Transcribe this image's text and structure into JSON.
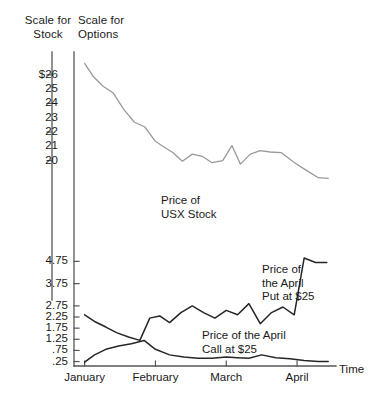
{
  "header": {
    "stock_scale_label": "Scale for\nStock",
    "options_scale_label": "Scale for\nOptions"
  },
  "axes": {
    "time_label": "Time",
    "stock_axis_name": "Scale for Stock",
    "options_axis_name": "Scale for Options"
  },
  "chart_data": {
    "type": "line",
    "title": "",
    "subtitle": "",
    "xlabel": "Time",
    "ylabel": "",
    "grid": false,
    "legend_position": "inline-annotations",
    "x_tick_labels": [
      "January",
      "February",
      "March",
      "April"
    ],
    "x_tick_positions": [
      0,
      1,
      2,
      3
    ],
    "xlim": [
      -0.15,
      3.55
    ],
    "stock_axis": {
      "name": "Scale for Stock",
      "tick_labels": [
        "$26",
        "25",
        "24",
        "23",
        "22",
        "21",
        "20"
      ],
      "ticked_marks": [
        "$26",
        "24",
        "22",
        "20"
      ],
      "tick_values": [
        26,
        25,
        24,
        23,
        22,
        21,
        20
      ],
      "ylim": [
        19.2,
        26.9
      ]
    },
    "options_axis": {
      "name": "Scale for Options",
      "tick_labels": [
        "4.75",
        "3.75",
        "2.75",
        "2.25",
        "1.75",
        "1.25",
        ".75",
        ".25"
      ],
      "tick_values": [
        4.75,
        3.75,
        2.75,
        2.25,
        1.75,
        1.25,
        0.75,
        0.25
      ],
      "ylim": [
        0.05,
        5.35
      ]
    },
    "series": [
      {
        "name": "Price of USX Stock",
        "axis": "stock",
        "color": "#9a9a9a",
        "annotation": "Price of\nUSX Stock",
        "x": [
          0.0,
          0.12,
          0.26,
          0.4,
          0.55,
          0.7,
          0.85,
          1.0,
          1.12,
          1.25,
          1.38,
          1.52,
          1.66,
          1.8,
          1.95,
          2.08,
          2.2,
          2.34,
          2.48,
          2.62,
          2.78,
          2.95,
          3.12,
          3.3,
          3.44
        ],
        "y": [
          26.8,
          25.9,
          25.2,
          24.75,
          23.6,
          22.7,
          22.35,
          21.35,
          20.95,
          20.55,
          19.95,
          20.45,
          20.3,
          19.85,
          20.0,
          21.05,
          19.75,
          20.45,
          20.7,
          20.6,
          20.55,
          19.9,
          19.35,
          18.8,
          18.75
        ]
      },
      {
        "name": "Price of the April Put at $25",
        "axis": "options",
        "color": "#262626",
        "annotation": "Price of\nthe April\nPut at $25",
        "x": [
          0.0,
          0.14,
          0.3,
          0.45,
          0.62,
          0.78,
          0.92,
          1.06,
          1.2,
          1.36,
          1.52,
          1.68,
          1.84,
          2.0,
          2.16,
          2.32,
          2.48,
          2.64,
          2.8,
          2.96,
          3.1,
          3.26,
          3.42
        ],
        "y": [
          2.35,
          2.05,
          1.8,
          1.55,
          1.35,
          1.2,
          2.2,
          2.3,
          2.0,
          2.45,
          2.75,
          2.45,
          2.2,
          2.55,
          2.35,
          2.85,
          1.95,
          2.45,
          2.7,
          2.35,
          4.9,
          4.7,
          4.7
        ]
      },
      {
        "name": "Price of the April Call at $25",
        "axis": "options",
        "color": "#262626",
        "annotation": "Price of the April\nCall at $25",
        "x": [
          0.0,
          0.14,
          0.3,
          0.48,
          0.66,
          0.84,
          1.0,
          1.2,
          1.4,
          1.6,
          1.8,
          2.0,
          2.16,
          2.32,
          2.5,
          2.7,
          2.9,
          3.1,
          3.3,
          3.44
        ],
        "y": [
          0.22,
          0.55,
          0.8,
          0.95,
          1.05,
          1.2,
          0.8,
          0.55,
          0.45,
          0.4,
          0.4,
          0.45,
          0.42,
          0.4,
          0.55,
          0.42,
          0.38,
          0.3,
          0.25,
          0.25
        ]
      }
    ]
  }
}
